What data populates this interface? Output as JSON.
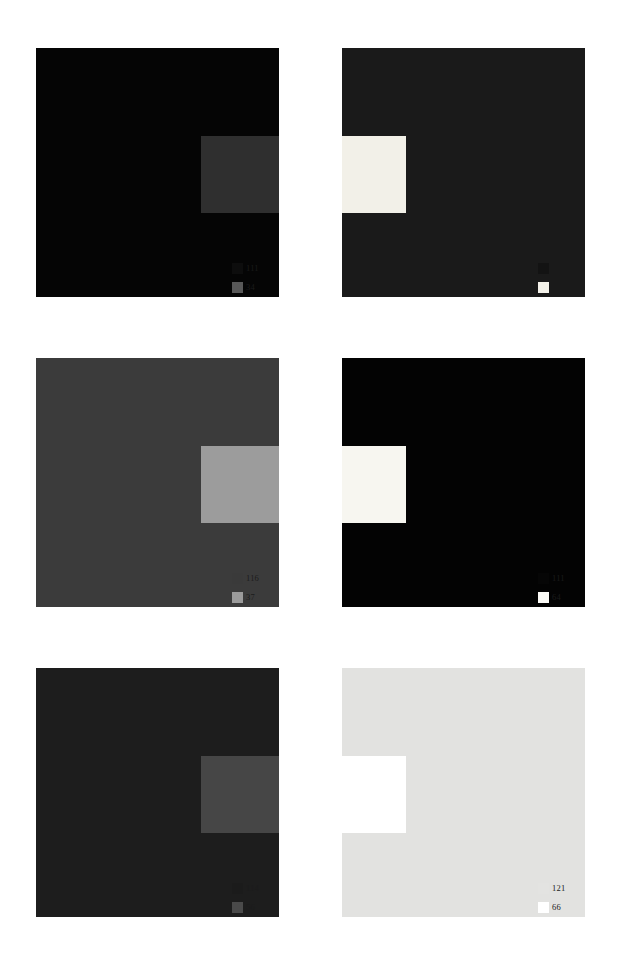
{
  "page": {
    "background": "#ffffff",
    "layout": "2-column-3-row-grid"
  },
  "panels": [
    {
      "id": "panel-1",
      "position": "top-left",
      "background_color": "#050505",
      "inset": {
        "color": "#2f2f2f",
        "side": "right"
      },
      "legend": [
        {
          "swatch_color": "#0d0d0d",
          "label": "111"
        },
        {
          "swatch_color": "#585858",
          "label": "34"
        }
      ]
    },
    {
      "id": "panel-2",
      "position": "top-right",
      "background_color": "#1a1a1a",
      "inset": {
        "color": "#f2f0e8",
        "side": "left"
      },
      "legend": [
        {
          "swatch_color": "#131313",
          "label": "114"
        },
        {
          "swatch_color": "#f3f1e9",
          "label": "41"
        }
      ]
    },
    {
      "id": "panel-3",
      "position": "middle-left",
      "background_color": "#3b3b3b",
      "inset": {
        "color": "#9c9c9c",
        "side": "right"
      },
      "legend": [
        {
          "swatch_color": "#3a3a3a",
          "label": "116"
        },
        {
          "swatch_color": "#9b9b9b",
          "label": "37"
        }
      ]
    },
    {
      "id": "panel-4",
      "position": "middle-right",
      "background_color": "#030303",
      "inset": {
        "color": "#f7f6f0",
        "side": "left"
      },
      "legend": [
        {
          "swatch_color": "#060606",
          "label": "111"
        },
        {
          "swatch_color": "#fbfaf6",
          "label": "64"
        }
      ]
    },
    {
      "id": "panel-5",
      "position": "bottom-left",
      "background_color": "#1d1d1d",
      "inset": {
        "color": "#464646",
        "side": "right"
      },
      "legend": [
        {
          "swatch_color": "#1b1b1b",
          "label": "114"
        },
        {
          "swatch_color": "#4a4a4a",
          "label": "56"
        }
      ]
    },
    {
      "id": "panel-6",
      "position": "bottom-right",
      "background_color": "#e2e2e0",
      "inset": {
        "color": "#ffffff",
        "side": "left"
      },
      "legend": [
        {
          "swatch_color": "#e3e3e1",
          "label": "121"
        },
        {
          "swatch_color": "#ffffff",
          "label": "66"
        }
      ]
    }
  ]
}
